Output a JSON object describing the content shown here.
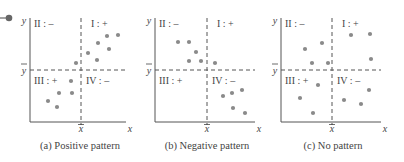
{
  "figure": {
    "bullet_color": "#666666",
    "axis_color": "#555555",
    "dot_color": "#8a8a8a",
    "panels": [
      {
        "id": "a",
        "caption": "(a) Positive pattern",
        "origin_x": 30,
        "mean_x": 81,
        "right_x": 126,
        "top_y": 18,
        "mean_y": 70,
        "bottom_y": 122,
        "quadrants": {
          "I": "I : +",
          "II": "II : –",
          "III": "III : +",
          "IV": "IV : –"
        },
        "points": [
          [
            48,
            101
          ],
          [
            57,
            107
          ],
          [
            59,
            93
          ],
          [
            72,
            93
          ],
          [
            71,
            81
          ],
          [
            76,
            63
          ],
          [
            88,
            53
          ],
          [
            97,
            60
          ],
          [
            98,
            43
          ],
          [
            109,
            49
          ],
          [
            107,
            36
          ],
          [
            118,
            35
          ]
        ]
      },
      {
        "id": "b",
        "caption": "(b) Negative pattern",
        "origin_x": 155,
        "mean_x": 207,
        "right_x": 255,
        "top_y": 18,
        "mean_y": 70,
        "bottom_y": 122,
        "quadrants": {
          "I": "I : +",
          "II": "II : –",
          "III": "III : +",
          "IV": "IV : –"
        },
        "points": [
          [
            178,
            42
          ],
          [
            189,
            42
          ],
          [
            196,
            52
          ],
          [
            189,
            61
          ],
          [
            201,
            61
          ],
          [
            215,
            63
          ],
          [
            223,
            96
          ],
          [
            232,
            93
          ],
          [
            242,
            90
          ],
          [
            233,
            108
          ],
          [
            245,
            113
          ]
        ]
      },
      {
        "id": "c",
        "caption": "(c) No pattern",
        "origin_x": 281,
        "mean_x": 332,
        "right_x": 381,
        "top_y": 18,
        "mean_y": 70,
        "bottom_y": 122,
        "quadrants": {
          "I": "I : +",
          "II": "II : –",
          "III": "III : +",
          "IV": "IV : –"
        },
        "points": [
          [
            305,
            49
          ],
          [
            322,
            43
          ],
          [
            312,
            63
          ],
          [
            328,
            63
          ],
          [
            351,
            35
          ],
          [
            370,
            34
          ],
          [
            371,
            59
          ],
          [
            318,
            85
          ],
          [
            300,
            98
          ],
          [
            313,
            113
          ],
          [
            344,
            100
          ],
          [
            361,
            104
          ],
          [
            369,
            90
          ]
        ]
      }
    ],
    "axis_labels": {
      "x": "x",
      "y": "y",
      "x_mean": "x̅",
      "y_mean": "y̅"
    }
  }
}
